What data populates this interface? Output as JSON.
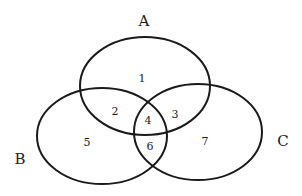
{
  "diagram": {
    "type": "venn",
    "sets": [
      {
        "name": "A",
        "label_x": 144,
        "label_y": 26,
        "cx": 145,
        "cy": 86,
        "rx": 65,
        "ry": 49
      },
      {
        "name": "B",
        "label_x": 20,
        "label_y": 164,
        "cx": 102,
        "cy": 136,
        "rx": 65,
        "ry": 48
      },
      {
        "name": "C",
        "label_x": 283,
        "label_y": 146,
        "cx": 198,
        "cy": 132,
        "rx": 64,
        "ry": 48
      }
    ],
    "regions": [
      {
        "label": "1",
        "sets": [
          "A"
        ],
        "x": 142,
        "y": 82
      },
      {
        "label": "2",
        "sets": [
          "A",
          "B"
        ],
        "x": 115,
        "y": 115
      },
      {
        "label": "3",
        "sets": [
          "A",
          "C"
        ],
        "x": 175,
        "y": 118
      },
      {
        "label": "4",
        "sets": [
          "A",
          "B",
          "C"
        ],
        "x": 148,
        "y": 124
      },
      {
        "label": "5",
        "sets": [
          "B"
        ],
        "x": 87,
        "y": 146
      },
      {
        "label": "6",
        "sets": [
          "B",
          "C"
        ],
        "x": 150,
        "y": 150
      },
      {
        "label": "7",
        "sets": [
          "C"
        ],
        "x": 205,
        "y": 145
      }
    ],
    "stroke_color": "#1a1a1a",
    "background_color": "#ffffff"
  }
}
